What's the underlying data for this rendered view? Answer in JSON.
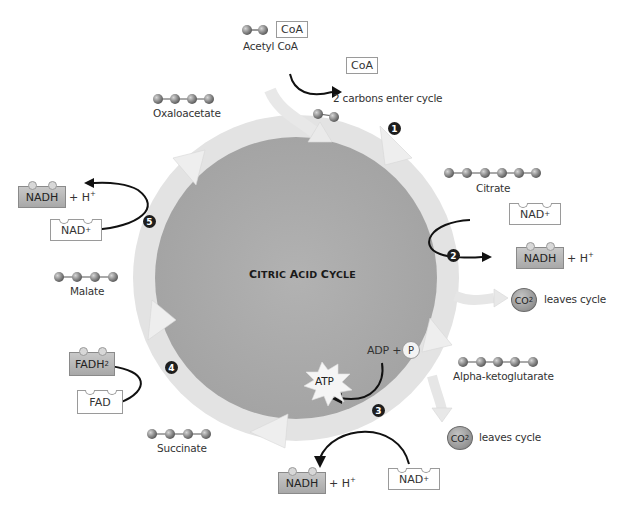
{
  "diagram": {
    "title": "Citric Acid Cycle",
    "title_parts": [
      "C",
      "ITRIC ",
      "A",
      "CID ",
      "C",
      "YCLE"
    ],
    "colors": {
      "background": "#ffffff",
      "inner_disc": "#a9a9a9",
      "ring": "#e2e2e2",
      "ring_arrow": "#ececec",
      "molecule": "#8a8a8a",
      "step_badge": "#1e1e1e",
      "arrow": "#111111"
    },
    "entry": {
      "molecule_label": "Acetyl CoA",
      "coa_tag": "CoA",
      "released_coa": "CoA",
      "note": "2 carbons enter cycle"
    },
    "intermediates": [
      {
        "name": "Oxaloacetate",
        "carbons": 4
      },
      {
        "name": "Citrate",
        "carbons": 6
      },
      {
        "name": "Alpha-ketoglutarate",
        "carbons": 5
      },
      {
        "name": "Succinate",
        "carbons": 4
      },
      {
        "name": "Malate",
        "carbons": 4
      }
    ],
    "steps": [
      {
        "number": "1"
      },
      {
        "number": "2",
        "input": "NAD+",
        "output": "NADH",
        "extra": "+ H+",
        "co2": "CO2",
        "co2_note": "leaves cycle"
      },
      {
        "number": "3",
        "input": "NAD+",
        "output": "NADH",
        "extra": "+ H+",
        "co2": "CO2",
        "co2_note": "leaves cycle",
        "atp_input": "ADP",
        "plus": "+",
        "phosphate": "P",
        "atp_output": "ATP"
      },
      {
        "number": "4",
        "input": "FAD",
        "output": "FADH2"
      },
      {
        "number": "5",
        "input": "NAD+",
        "output": "NADH",
        "extra": "+ H+"
      }
    ],
    "labels": {
      "nad": "NAD",
      "nadh": "NADH",
      "fad": "FAD",
      "fadh": "FADH",
      "sub2": "2",
      "sup_plus": "+",
      "plus_h": "+ H",
      "co": "CO",
      "leaves_cycle": "leaves cycle",
      "adp": "ADP",
      "plus": "+",
      "p": "P",
      "atp": "ATP"
    }
  }
}
